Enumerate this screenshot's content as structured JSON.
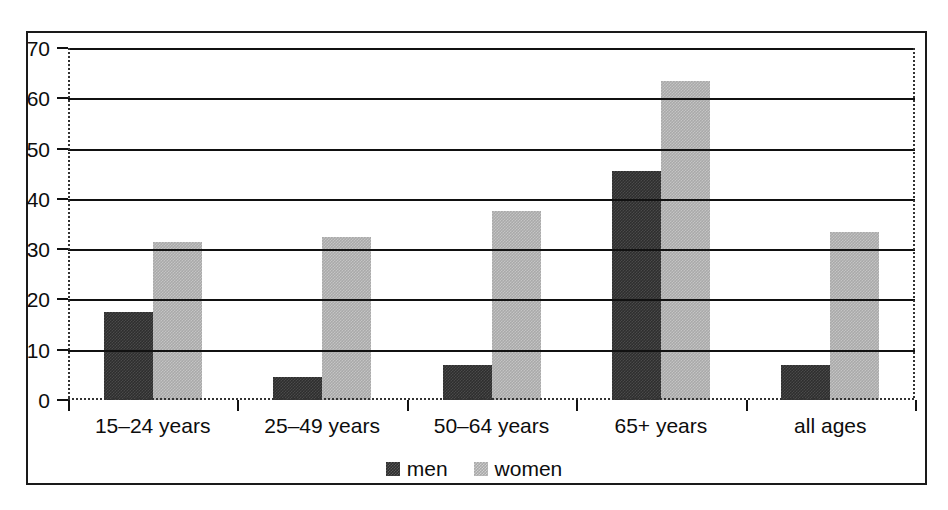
{
  "chart_data": {
    "type": "bar",
    "title": "",
    "subtitle": "",
    "xlabel": "",
    "ylabel": "",
    "categories": [
      "15–24 years",
      "25–49 years",
      "50–64 years",
      "65+ years",
      "all ages"
    ],
    "series": [
      {
        "name": "men",
        "values": [
          17.5,
          4.5,
          7.0,
          45.5,
          7.0
        ],
        "color": "#2e2e2e",
        "pattern": "dither-dark"
      },
      {
        "name": "women",
        "values": [
          31.5,
          32.5,
          37.5,
          63.5,
          33.5
        ],
        "color": "#a9a9a9",
        "pattern": "dither-light"
      }
    ],
    "ylim": [
      0,
      70
    ],
    "ytick_values": [
      0,
      10,
      20,
      30,
      40,
      50,
      60,
      70
    ],
    "ytick_labels": [
      "0",
      "10",
      "20",
      "30",
      "40",
      "50",
      "60",
      "70"
    ],
    "grid": {
      "horizontal": true,
      "vertical": false,
      "color": "#111111"
    },
    "legend": {
      "position": "bottom-center",
      "entries": [
        "men",
        "women"
      ]
    },
    "axis": {
      "baseline_style": "dotted",
      "spine_style": "dotted",
      "frame": true
    }
  },
  "legend": {
    "items": [
      {
        "label": "men"
      },
      {
        "label": "women"
      }
    ]
  }
}
